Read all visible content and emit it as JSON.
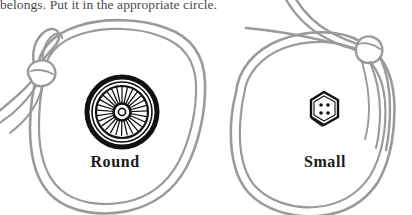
{
  "page": {
    "instruction": "belongs.  Put it in the appropriate circle.",
    "background_color": "#ffffff",
    "string_color": "#9a9a9a",
    "ink_color": "#1a1a1a",
    "text_color": "#4a4a4a"
  },
  "sorting_circles": [
    {
      "id": "round",
      "label": "Round",
      "item_name": "spoked-wheel",
      "item_description": "wheel with radial spokes",
      "knot_position": "upper-left"
    },
    {
      "id": "small",
      "label": "Small",
      "item_name": "hexagonal-button",
      "item_description": "hexagon button with four holes",
      "hole_count": 4,
      "knot_position": "upper-right"
    }
  ]
}
